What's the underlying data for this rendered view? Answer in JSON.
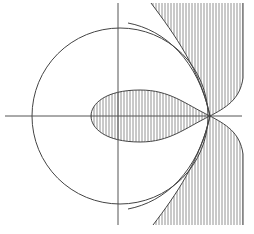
{
  "figure": {
    "labels": [],
    "colors": {
      "line": "#444444",
      "hatch": "#777777",
      "background": "#ffffff"
    },
    "elements": [
      {
        "id": "real-axis",
        "kind": "axis"
      },
      {
        "id": "imaginary-axis",
        "kind": "axis"
      },
      {
        "id": "circle",
        "kind": "curve"
      },
      {
        "id": "teardrop-region",
        "kind": "hatched-region"
      },
      {
        "id": "upper-right-region",
        "kind": "hatched-region"
      },
      {
        "id": "lower-right-region",
        "kind": "hatched-region"
      }
    ]
  }
}
